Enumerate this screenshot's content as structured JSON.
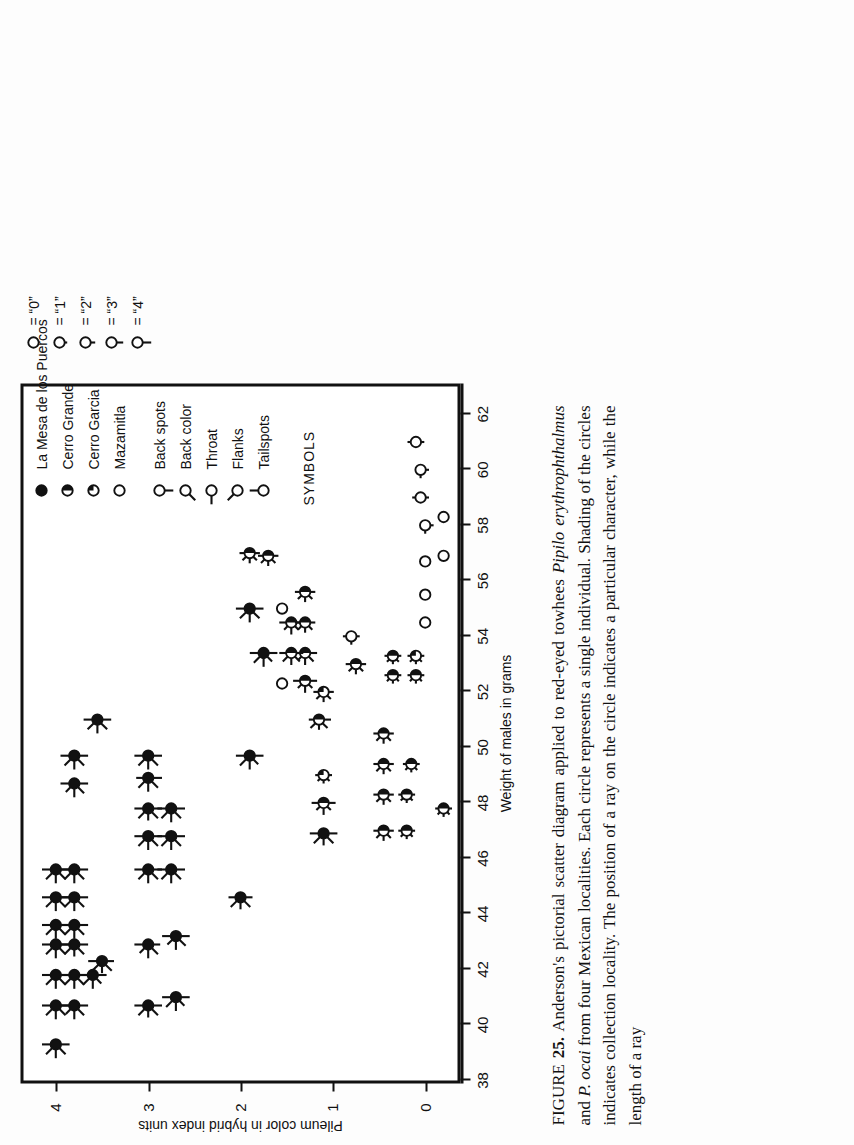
{
  "figure": {
    "label": "FIGURE",
    "number": "25.",
    "caption_parts": {
      "p1": " Anderson's pictorial scatter diagram applied to red-eyed towhees ",
      "sp1": "Pipilo erythrophthalmus",
      "p2": " and ",
      "sp2": "P. ocai",
      "p3": " from four Mexican localities. Each circle represents a single individual. Shading of the circles indicates collection locality. The position of a ray on the circle indicates a particular character, while the length of a ray"
    },
    "caption_full": "FIGURE 25. Anderson's pictorial scatter diagram applied to red-eyed towhees Pipilo erythrophthalmus and P. ocai from four Mexican localities. Each circle represents a single individual. Shading of the circles indicates collection locality. The position of a ray on the circle indicates a particular character, while the length of a ray"
  },
  "legend": {
    "symbols_heading": "SYMBOLS",
    "localities": [
      {
        "label": "La Mesa de los Puercos",
        "symbol": "filled-circle"
      },
      {
        "label": "Cerro Grande",
        "symbol": "half-filled-circle"
      },
      {
        "label": "Cerro Garcia",
        "symbol": "quarter-filled-circle"
      },
      {
        "label": "Mazamitla",
        "symbol": "open-circle"
      }
    ],
    "characters": [
      {
        "label": "Back spots",
        "symbol": "ray-circle",
        "ray_angle_deg": 270
      },
      {
        "label": "Back color",
        "symbol": "ray-circle",
        "ray_angle_deg": 225
      },
      {
        "label": "Throat",
        "symbol": "ray-circle",
        "ray_angle_deg": 180
      },
      {
        "label": "Flanks",
        "symbol": "ray-circle",
        "ray_angle_deg": 135
      },
      {
        "label": "Tailspots",
        "symbol": "ray-circle",
        "ray_angle_deg": 90
      }
    ],
    "scale": [
      {
        "value": "0",
        "text": "= “0”",
        "ray_len": 0
      },
      {
        "value": "1",
        "text": "= “1”",
        "ray_len": 3
      },
      {
        "value": "2",
        "text": "= “2”",
        "ray_len": 5
      },
      {
        "value": "3",
        "text": "= “3”",
        "ray_len": 7
      },
      {
        "value": "4",
        "text": "= “4”",
        "ray_len": 9
      }
    ]
  },
  "chart_data": {
    "type": "scatter",
    "title": "",
    "xlabel": "Weight of males in grams",
    "ylabel": "Pileum color in hybrid index units",
    "xlim": [
      38,
      63
    ],
    "ylim": [
      -0.35,
      4.35
    ],
    "xticks": [
      38,
      40,
      42,
      44,
      46,
      48,
      50,
      52,
      54,
      56,
      58,
      60,
      62
    ],
    "yticks": [
      0,
      1,
      2,
      3,
      4
    ],
    "grid": false,
    "legend_position": "top-right-outside",
    "note": "Each point is a circle whose fill encodes locality and whose rays encode 5 characters (Back spots, Back color, Throat, Flanks, Tailspots), each scored 0-4.",
    "points": [
      {
        "x": 39.3,
        "y": 4.0,
        "fill": "filled",
        "rays": [
          4,
          4,
          4,
          4,
          4
        ]
      },
      {
        "x": 40.7,
        "y": 4.0,
        "fill": "filled",
        "rays": [
          4,
          4,
          4,
          4,
          4
        ]
      },
      {
        "x": 41.8,
        "y": 4.0,
        "fill": "filled",
        "rays": [
          4,
          4,
          4,
          4,
          4
        ]
      },
      {
        "x": 42.9,
        "y": 4.0,
        "fill": "filled",
        "rays": [
          4,
          4,
          4,
          4,
          4
        ]
      },
      {
        "x": 43.6,
        "y": 4.0,
        "fill": "filled",
        "rays": [
          4,
          4,
          4,
          4,
          4
        ]
      },
      {
        "x": 44.6,
        "y": 4.0,
        "fill": "filled",
        "rays": [
          4,
          4,
          4,
          4,
          4
        ]
      },
      {
        "x": 45.6,
        "y": 4.0,
        "fill": "filled",
        "rays": [
          4,
          4,
          4,
          4,
          4
        ]
      },
      {
        "x": 40.7,
        "y": 3.8,
        "fill": "filled",
        "rays": [
          4,
          4,
          4,
          3,
          4
        ]
      },
      {
        "x": 41.8,
        "y": 3.8,
        "fill": "filled",
        "rays": [
          4,
          4,
          4,
          4,
          4
        ]
      },
      {
        "x": 42.9,
        "y": 3.8,
        "fill": "filled",
        "rays": [
          4,
          4,
          3,
          4,
          4
        ]
      },
      {
        "x": 43.6,
        "y": 3.8,
        "fill": "filled",
        "rays": [
          4,
          4,
          4,
          4,
          4
        ]
      },
      {
        "x": 44.6,
        "y": 3.8,
        "fill": "filled",
        "rays": [
          4,
          4,
          4,
          4,
          4
        ]
      },
      {
        "x": 45.6,
        "y": 3.8,
        "fill": "filled",
        "rays": [
          4,
          4,
          4,
          4,
          4
        ]
      },
      {
        "x": 48.7,
        "y": 3.8,
        "fill": "filled",
        "rays": [
          4,
          4,
          4,
          3,
          4
        ]
      },
      {
        "x": 49.7,
        "y": 3.8,
        "fill": "filled",
        "rays": [
          4,
          4,
          4,
          4,
          4
        ]
      },
      {
        "x": 41.8,
        "y": 3.6,
        "fill": "filled",
        "rays": [
          4,
          3,
          4,
          4,
          3
        ]
      },
      {
        "x": 42.3,
        "y": 3.5,
        "fill": "filled",
        "rays": [
          3,
          4,
          3,
          4,
          4
        ]
      },
      {
        "x": 51.0,
        "y": 3.55,
        "fill": "filled",
        "rays": [
          4,
          4,
          4,
          4,
          4
        ]
      },
      {
        "x": 40.7,
        "y": 3.0,
        "fill": "filled",
        "rays": [
          4,
          4,
          3,
          4,
          4
        ]
      },
      {
        "x": 42.9,
        "y": 3.0,
        "fill": "filled",
        "rays": [
          3,
          4,
          4,
          3,
          4
        ]
      },
      {
        "x": 45.6,
        "y": 3.0,
        "fill": "filled",
        "rays": [
          4,
          4,
          4,
          4,
          4
        ]
      },
      {
        "x": 46.8,
        "y": 3.0,
        "fill": "filled",
        "rays": [
          4,
          4,
          4,
          4,
          4
        ]
      },
      {
        "x": 47.8,
        "y": 3.0,
        "fill": "filled",
        "rays": [
          4,
          4,
          3,
          4,
          4
        ]
      },
      {
        "x": 48.9,
        "y": 3.0,
        "fill": "filled",
        "rays": [
          4,
          4,
          4,
          4,
          3
        ]
      },
      {
        "x": 49.7,
        "y": 3.0,
        "fill": "filled",
        "rays": [
          4,
          4,
          4,
          4,
          4
        ]
      },
      {
        "x": 41.0,
        "y": 2.7,
        "fill": "filled",
        "rays": [
          4,
          3,
          4,
          4,
          4
        ]
      },
      {
        "x": 43.2,
        "y": 2.7,
        "fill": "filled",
        "rays": [
          4,
          4,
          4,
          3,
          4
        ]
      },
      {
        "x": 45.6,
        "y": 2.75,
        "fill": "filled",
        "rays": [
          4,
          4,
          4,
          4,
          4
        ]
      },
      {
        "x": 46.8,
        "y": 2.75,
        "fill": "filled",
        "rays": [
          4,
          4,
          4,
          4,
          4
        ]
      },
      {
        "x": 47.8,
        "y": 2.75,
        "fill": "filled",
        "rays": [
          4,
          4,
          4,
          4,
          4
        ]
      },
      {
        "x": 44.6,
        "y": 2.0,
        "fill": "filled",
        "rays": [
          3,
          4,
          3,
          4,
          3
        ]
      },
      {
        "x": 49.7,
        "y": 1.9,
        "fill": "filled",
        "rays": [
          4,
          3,
          4,
          4,
          4
        ]
      },
      {
        "x": 55.0,
        "y": 1.9,
        "fill": "filled",
        "rays": [
          4,
          4,
          4,
          4,
          4
        ]
      },
      {
        "x": 53.4,
        "y": 1.75,
        "fill": "filled",
        "rays": [
          4,
          3,
          4,
          4,
          4
        ]
      },
      {
        "x": 46.9,
        "y": 1.1,
        "fill": "filled",
        "rays": [
          4,
          4,
          3,
          4,
          4
        ]
      },
      {
        "x": 48.0,
        "y": 1.1,
        "fill": "half",
        "rays": [
          3,
          2,
          3,
          2,
          3
        ]
      },
      {
        "x": 49.0,
        "y": 1.1,
        "fill": "quarter",
        "rays": [
          1,
          1,
          1,
          1,
          1
        ]
      },
      {
        "x": 51.0,
        "y": 1.15,
        "fill": "half",
        "rays": [
          3,
          3,
          2,
          3,
          2
        ]
      },
      {
        "x": 52.0,
        "y": 1.1,
        "fill": "quarter",
        "rays": [
          2,
          2,
          2,
          2,
          2
        ]
      },
      {
        "x": 52.4,
        "y": 1.3,
        "fill": "half",
        "rays": [
          3,
          2,
          3,
          2,
          3
        ]
      },
      {
        "x": 53.4,
        "y": 1.3,
        "fill": "half",
        "rays": [
          3,
          3,
          3,
          2,
          3
        ]
      },
      {
        "x": 53.4,
        "y": 1.45,
        "fill": "half",
        "rays": [
          3,
          3,
          3,
          3,
          3
        ]
      },
      {
        "x": 54.5,
        "y": 1.45,
        "fill": "half",
        "rays": [
          3,
          2,
          3,
          2,
          3
        ]
      },
      {
        "x": 54.5,
        "y": 1.3,
        "fill": "half",
        "rays": [
          2,
          2,
          2,
          2,
          2
        ]
      },
      {
        "x": 55.0,
        "y": 1.55,
        "fill": "open",
        "rays": [
          0,
          0,
          0,
          0,
          0
        ]
      },
      {
        "x": 52.3,
        "y": 1.55,
        "fill": "open",
        "rays": [
          0,
          0,
          0,
          0,
          0
        ]
      },
      {
        "x": 55.6,
        "y": 1.3,
        "fill": "half",
        "rays": [
          2,
          2,
          2,
          2,
          2
        ]
      },
      {
        "x": 56.9,
        "y": 1.7,
        "fill": "half",
        "rays": [
          2,
          2,
          2,
          2,
          2
        ]
      },
      {
        "x": 57.0,
        "y": 1.9,
        "fill": "half",
        "rays": [
          2,
          2,
          2,
          2,
          2
        ]
      },
      {
        "x": 53.0,
        "y": 0.75,
        "fill": "half",
        "rays": [
          2,
          2,
          2,
          2,
          2
        ]
      },
      {
        "x": 54.0,
        "y": 0.8,
        "fill": "open",
        "rays": [
          1,
          0,
          1,
          0,
          1
        ]
      },
      {
        "x": 47.0,
        "y": 0.45,
        "fill": "half",
        "rays": [
          2,
          2,
          2,
          2,
          2
        ]
      },
      {
        "x": 48.3,
        "y": 0.45,
        "fill": "half",
        "rays": [
          2,
          2,
          2,
          2,
          2
        ]
      },
      {
        "x": 49.4,
        "y": 0.45,
        "fill": "half",
        "rays": [
          2,
          2,
          2,
          2,
          2
        ]
      },
      {
        "x": 50.5,
        "y": 0.45,
        "fill": "half",
        "rays": [
          2,
          2,
          2,
          2,
          2
        ]
      },
      {
        "x": 52.6,
        "y": 0.35,
        "fill": "half",
        "rays": [
          1,
          1,
          1,
          1,
          1
        ]
      },
      {
        "x": 53.3,
        "y": 0.35,
        "fill": "half",
        "rays": [
          1,
          1,
          1,
          1,
          1
        ]
      },
      {
        "x": 47.0,
        "y": 0.2,
        "fill": "half",
        "rays": [
          1,
          1,
          1,
          1,
          1
        ]
      },
      {
        "x": 48.3,
        "y": 0.2,
        "fill": "half",
        "rays": [
          1,
          1,
          1,
          1,
          1
        ]
      },
      {
        "x": 49.4,
        "y": 0.15,
        "fill": "half",
        "rays": [
          1,
          1,
          1,
          1,
          1
        ]
      },
      {
        "x": 52.6,
        "y": 0.1,
        "fill": "half",
        "rays": [
          1,
          1,
          1,
          1,
          1
        ]
      },
      {
        "x": 53.3,
        "y": 0.1,
        "fill": "quarter",
        "rays": [
          1,
          1,
          1,
          1,
          1
        ]
      },
      {
        "x": 54.5,
        "y": 0.0,
        "fill": "open",
        "rays": [
          0,
          0,
          0,
          0,
          0
        ]
      },
      {
        "x": 55.5,
        "y": 0.0,
        "fill": "open",
        "rays": [
          0,
          0,
          0,
          0,
          0
        ]
      },
      {
        "x": 56.7,
        "y": 0.0,
        "fill": "open",
        "rays": [
          0,
          0,
          0,
          0,
          0
        ]
      },
      {
        "x": 56.9,
        "y": -0.2,
        "fill": "open",
        "rays": [
          0,
          0,
          0,
          0,
          0
        ]
      },
      {
        "x": 58.0,
        "y": 0.0,
        "fill": "open",
        "rays": [
          1,
          0,
          1,
          0,
          0
        ]
      },
      {
        "x": 58.3,
        "y": -0.2,
        "fill": "open",
        "rays": [
          0,
          0,
          0,
          0,
          0
        ]
      },
      {
        "x": 59.0,
        "y": 0.05,
        "fill": "open",
        "rays": [
          1,
          0,
          0,
          0,
          1
        ]
      },
      {
        "x": 60.0,
        "y": 0.05,
        "fill": "open",
        "rays": [
          1,
          0,
          1,
          0,
          0
        ]
      },
      {
        "x": 61.0,
        "y": 0.1,
        "fill": "open",
        "rays": [
          1,
          0,
          0,
          0,
          1
        ]
      },
      {
        "x": 47.8,
        "y": -0.2,
        "fill": "half",
        "rays": [
          1,
          1,
          1,
          1,
          1
        ]
      }
    ]
  }
}
